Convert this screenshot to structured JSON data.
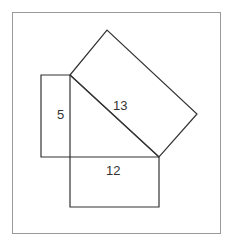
{
  "diagram": {
    "type": "pythagorean-theorem-illustration",
    "colors": {
      "frame_stroke": "#9a9a9a",
      "shape_stroke": "#333333",
      "background": "#ffffff"
    },
    "labels": {
      "short_leg": "5",
      "long_leg": "12",
      "hypotenuse": "13"
    },
    "triangle": {
      "vertices": [
        [
          70,
          75
        ],
        [
          70,
          157
        ],
        [
          159,
          157
        ]
      ]
    },
    "shapes": {
      "left_rect": {
        "points": "41,75 70,75 70,157 41,157"
      },
      "bottom_rect": {
        "points": "70,157 159,157 159,207 70,207"
      },
      "hyp_rect": {
        "points": "70,75 107,30 197,114 159,157"
      },
      "hypotenuse_line": {
        "points": "70,75 159,157"
      }
    }
  }
}
